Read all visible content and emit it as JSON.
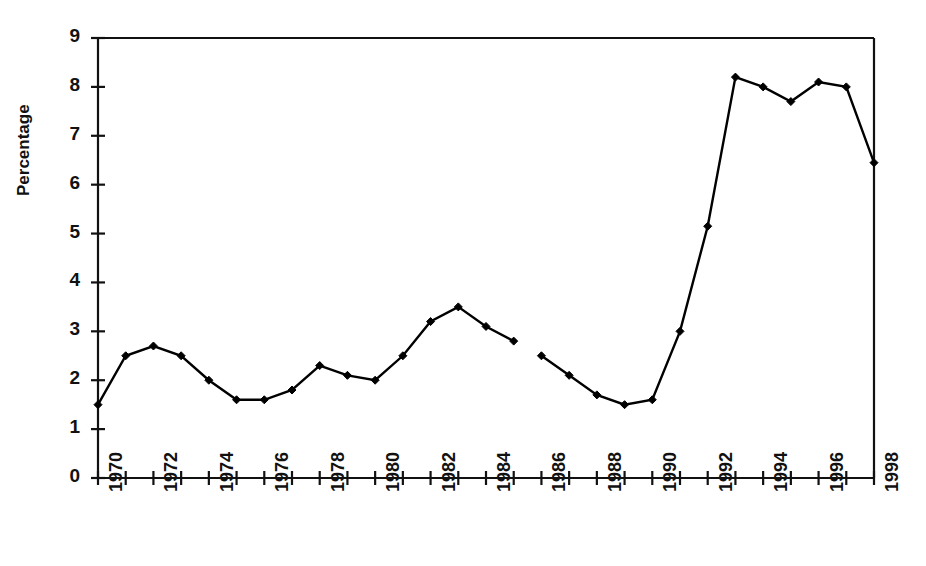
{
  "chart_data": {
    "type": "line",
    "title": "",
    "xlabel": "",
    "ylabel": "Percentage",
    "xlim": [
      1970,
      1998
    ],
    "ylim": [
      0,
      9
    ],
    "ytick_labels": [
      "0",
      "1",
      "2",
      "3",
      "4",
      "5",
      "6",
      "7",
      "8",
      "9"
    ],
    "yticks": [
      0,
      1,
      2,
      3,
      4,
      5,
      6,
      7,
      8,
      9
    ],
    "xtick_labels": [
      "1970",
      "1972",
      "1974",
      "1976",
      "1978",
      "1980",
      "1982",
      "1984",
      "1986",
      "1988",
      "1990",
      "1992",
      "1994",
      "1996",
      "1998"
    ],
    "xticks_labeled": [
      1970,
      1972,
      1974,
      1976,
      1978,
      1980,
      1982,
      1984,
      1986,
      1988,
      1990,
      1992,
      1994,
      1996,
      1998
    ],
    "xticks_all": [
      1970,
      1971,
      1972,
      1973,
      1974,
      1975,
      1976,
      1977,
      1978,
      1979,
      1980,
      1981,
      1982,
      1983,
      1984,
      1985,
      1986,
      1987,
      1988,
      1989,
      1990,
      1991,
      1992,
      1993,
      1994,
      1995,
      1996,
      1997,
      1998
    ],
    "grid": false,
    "legend": false,
    "marker": "filled-diamond",
    "line_color": "#000000",
    "x": [
      1970,
      1971,
      1972,
      1973,
      1974,
      1975,
      1976,
      1977,
      1978,
      1979,
      1980,
      1981,
      1982,
      1983,
      1984,
      1985,
      1986,
      1987,
      1988,
      1989,
      1990,
      1991,
      1992,
      1993,
      1994,
      1995,
      1996,
      1997,
      1998
    ],
    "values": [
      1.5,
      2.5,
      2.7,
      2.5,
      2.0,
      1.6,
      1.6,
      1.8,
      2.3,
      2.1,
      2.0,
      2.5,
      3.2,
      3.5,
      3.1,
      2.8,
      2.5,
      2.1,
      1.7,
      1.5,
      1.6,
      3.0,
      5.15,
      8.2,
      8.0,
      7.7,
      8.1,
      8.0,
      6.45
    ],
    "segments": [
      {
        "name": "1970-1985",
        "x": [
          1970,
          1971,
          1972,
          1973,
          1974,
          1975,
          1976,
          1977,
          1978,
          1979,
          1980,
          1981,
          1982,
          1983,
          1984,
          1985
        ],
        "values": [
          1.5,
          2.5,
          2.7,
          2.5,
          2.0,
          1.6,
          1.6,
          1.8,
          2.3,
          2.1,
          2.0,
          2.5,
          3.2,
          3.5,
          3.1,
          2.8
        ]
      },
      {
        "name": "1986-1998",
        "x": [
          1986,
          1987,
          1988,
          1989,
          1990,
          1991,
          1992,
          1993,
          1994,
          1995,
          1996,
          1997,
          1998
        ],
        "values": [
          2.5,
          2.1,
          1.7,
          1.5,
          1.6,
          3.0,
          5.15,
          8.2,
          8.0,
          7.7,
          8.1,
          8.0,
          6.45
        ]
      }
    ]
  }
}
